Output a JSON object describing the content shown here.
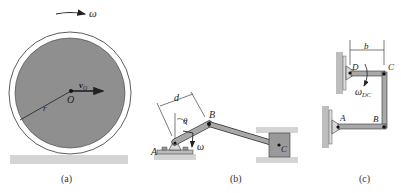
{
  "figure": {
    "panels": [
      {
        "id": "a",
        "caption": "(a)",
        "labels": {
          "omega": "ω",
          "velocity": "v",
          "velocity_sub": "O",
          "center": "O",
          "radius": "r"
        }
      },
      {
        "id": "b",
        "caption": "(b)",
        "labels": {
          "A": "A",
          "B": "B",
          "C": "C",
          "d": "d",
          "theta": "θ",
          "omega": "ω"
        }
      },
      {
        "id": "c",
        "caption": "(c)",
        "labels": {
          "A": "A",
          "B": "B",
          "C": "C",
          "D": "D",
          "b": "b",
          "omega": "ω",
          "omega_sub": "DC"
        }
      }
    ],
    "colors": {
      "disk_fill": "#8f8f8f",
      "ground": "#cfcfcf",
      "link": "#a8a8a8",
      "line": "#222222"
    }
  }
}
